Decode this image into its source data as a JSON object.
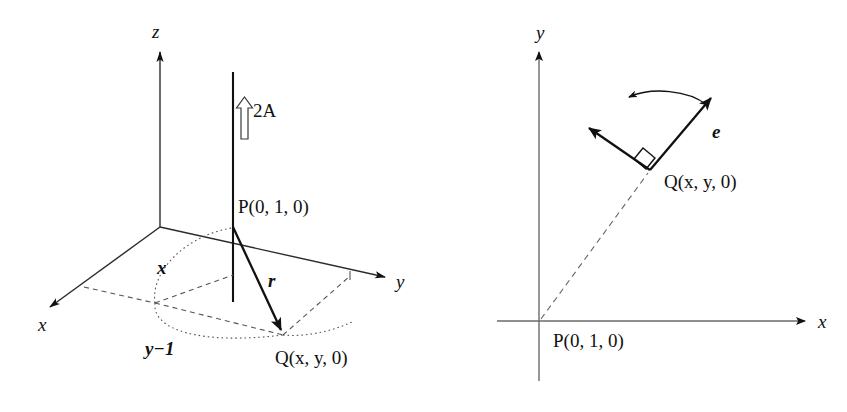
{
  "figure": {
    "background_color": "#ffffff",
    "stroke_color": "#111111",
    "dash_color": "#555555"
  },
  "panel_left": {
    "name": "three-dimensional-coordinate-view",
    "axes": [
      {
        "key": "x",
        "label": "x",
        "x": 38,
        "y": 315,
        "direction": "down-left"
      },
      {
        "key": "y",
        "label": "y",
        "x": 396,
        "y": 272,
        "direction": "right"
      },
      {
        "key": "z",
        "label": "z",
        "x": 152,
        "y": 22,
        "direction": "up"
      }
    ],
    "annotations": [
      {
        "key": "current",
        "label": "2A",
        "x": 253,
        "y": 101,
        "kind": "current-arrow-label"
      },
      {
        "key": "point_p",
        "label": "P(0, 1, 0)",
        "x": 238,
        "y": 197,
        "kind": "point-label"
      },
      {
        "key": "point_q",
        "label": "Q(x, y, 0)",
        "x": 275,
        "y": 348,
        "kind": "point-label"
      },
      {
        "key": "vector_r",
        "label": "r",
        "x": 268,
        "y": 271,
        "kind": "vector-label"
      },
      {
        "key": "dist_x",
        "label": "x",
        "x": 157,
        "y": 258,
        "kind": "distance-label"
      },
      {
        "key": "dist_y1",
        "label": "y−1",
        "x": 145,
        "y": 339,
        "kind": "distance-label"
      }
    ],
    "geometry": {
      "origin": [
        160,
        227
      ],
      "wire_top": [
        233,
        72
      ],
      "wire_bottom": [
        233,
        302
      ],
      "point_p": [
        233,
        227
      ],
      "point_q": [
        283,
        335
      ],
      "current_direction": "up",
      "current_value": "2A"
    }
  },
  "panel_right": {
    "name": "xy-plane-projection-view",
    "axes": [
      {
        "key": "x",
        "label": "x",
        "x": 818,
        "y": 312,
        "direction": "right"
      },
      {
        "key": "y",
        "label": "y",
        "x": 536,
        "y": 23,
        "direction": "up"
      }
    ],
    "annotations": [
      {
        "key": "point_p",
        "label": "P(0, 1, 0)",
        "x": 553,
        "y": 331,
        "kind": "point-label"
      },
      {
        "key": "point_q",
        "label": "Q(x, y, 0)",
        "x": 664,
        "y": 172,
        "kind": "point-label"
      },
      {
        "key": "unit_vector_e",
        "label": "e",
        "x": 712,
        "y": 122,
        "kind": "vector-label"
      }
    ],
    "geometry": {
      "origin": [
        539,
        321
      ],
      "point_q": [
        650,
        170
      ],
      "e_tip": [
        713,
        95
      ],
      "field_tip": [
        586,
        124
      ],
      "right_angle_marker": true,
      "rotation_arrow": "counter-clockwise"
    }
  }
}
